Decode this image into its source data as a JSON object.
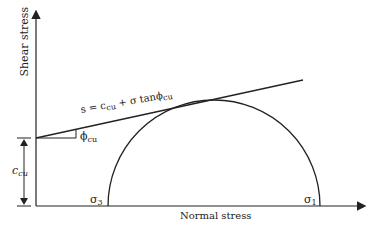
{
  "diagram": {
    "y_axis_label": "Shear stress",
    "x_axis_label": "Normal stress",
    "envelope_equation": {
      "s": "s = c",
      "cu1": "cu",
      "mid": " + σ tanϕ",
      "cu2": "cu"
    },
    "angle_label": {
      "sym": "ϕ",
      "sub": "cu"
    },
    "intercept_label": {
      "sym": "c",
      "sub": "cu"
    },
    "sigma3_label": {
      "sym": "σ",
      "sub": "3"
    },
    "sigma1_label": {
      "sym": "σ",
      "sub": "1"
    },
    "colors": {
      "line": "#222222",
      "background": "#ffffff"
    }
  }
}
